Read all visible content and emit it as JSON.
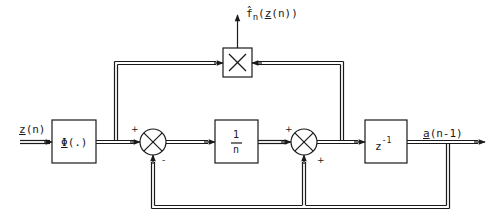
{
  "diagram": {
    "type": "block-diagram",
    "input": {
      "label_symbol": "z",
      "label_arg": "(n)"
    },
    "output": {
      "label_symbol": "a",
      "label_arg": "(n-1)"
    },
    "top_output": {
      "label_hat": "f̂",
      "label_sub": "n",
      "label_open": "(",
      "label_symbol": "z",
      "label_arg": "(n))"
    },
    "blocks": {
      "phi": {
        "symbol": "Φ",
        "arg": "(.)"
      },
      "gain": {
        "numerator": "1",
        "denominator": "n"
      },
      "delay": {
        "base": "z",
        "exponent": "-1"
      },
      "multiplier": {
        "glyph": "×"
      }
    },
    "summers": {
      "sum1": {
        "in_top_left_sign": "+",
        "in_bottom_sign": "-"
      },
      "sum2": {
        "in_top_left_sign": "+",
        "in_bottom_sign": "+"
      }
    },
    "colors": {
      "stroke": "#1a1a1a",
      "background": "#ffffff"
    }
  }
}
